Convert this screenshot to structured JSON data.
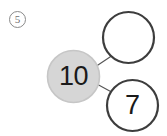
{
  "worksheet": {
    "problem_number": "5",
    "type": "number-bond"
  },
  "bond": {
    "whole": {
      "label": "whole-circle",
      "value": "10",
      "fill": "#d6d6d6",
      "stroke": "#c2c2c2"
    },
    "parts": [
      {
        "label": "part-circle-top",
        "value": "",
        "filled": false,
        "fill": "#ffffff",
        "stroke": "#3d3d3d"
      },
      {
        "label": "part-circle-bottom",
        "value": "7",
        "filled": true,
        "fill": "#ffffff",
        "stroke": "#3d3d3d"
      }
    ],
    "connectors": [
      {
        "name": "connector-to-top",
        "from": [
          96,
          66
        ],
        "to": [
          112,
          55
        ]
      },
      {
        "name": "connector-to-bottom",
        "from": [
          96,
          84
        ],
        "to": [
          114,
          94
        ]
      }
    ]
  },
  "colors": {
    "background": "#ffffff",
    "text": "#1a1a1a",
    "problem_number_ink": "#6f6f6f",
    "connector": "#555555"
  }
}
